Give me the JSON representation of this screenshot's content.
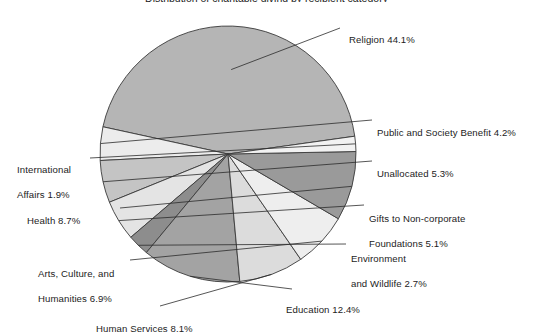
{
  "chart": {
    "title": "Distribution of charitable giving by recipient category",
    "title_visible": false
  },
  "chart_data": {
    "type": "pie",
    "title": "",
    "xlabel": "",
    "ylabel": "",
    "legend_position": "none",
    "grid": false,
    "units": "percent",
    "categories": [
      "Religion",
      "Public and Society Benefit",
      "Unallocated",
      "Gifts to Non-corporate Foundations",
      "Environment and Wildlife",
      "Education",
      "Human Services",
      "Arts, Culture, and Humanities",
      "Health",
      "International Affairs"
    ],
    "values": [
      44.1,
      4.2,
      5.3,
      5.1,
      2.7,
      12.4,
      8.1,
      6.9,
      8.7,
      1.9
    ],
    "slices": [
      {
        "label": "Religion 44.1%",
        "name": "Religion",
        "value": 44.1,
        "color": "#b5b5b5",
        "label_line1": "Religion 44.1%",
        "label_line2": ""
      },
      {
        "label": "Public and Society Benefit 4.2%",
        "name": "Public and Society Benefit",
        "value": 4.2,
        "color": "#ececec",
        "label_line1": "Public and Society Benefit 4.2%",
        "label_line2": ""
      },
      {
        "label": "Unallocated 5.3%",
        "name": "Unallocated",
        "value": 5.3,
        "color": "#c4c4c4",
        "label_line1": "Unallocated 5.3%",
        "label_line2": ""
      },
      {
        "label": "Gifts to Non-corporate Foundations 5.1%",
        "name": "Gifts to Non-corporate Foundations",
        "value": 5.1,
        "color": "#e4e4e4",
        "label_line1": "Gifts to Non-corporate",
        "label_line2": "Foundations 5.1%"
      },
      {
        "label": "Environment and Wildlife 2.7%",
        "name": "Environment and Wildlife",
        "value": 2.7,
        "color": "#8d8d8d",
        "label_line1": "Environment",
        "label_line2": "and Wildlife 2.7%"
      },
      {
        "label": "Education 12.4%",
        "name": "Education",
        "value": 12.4,
        "color": "#a3a3a3",
        "label_line1": "Education 12.4%",
        "label_line2": ""
      },
      {
        "label": "Human Services 8.1%",
        "name": "Human Services",
        "value": 8.1,
        "color": "#dcdcdc",
        "label_line1": "Human Services 8.1%",
        "label_line2": ""
      },
      {
        "label": "Arts, Culture, and Humanities 6.9%",
        "name": "Arts, Culture, and Humanities",
        "value": 6.9,
        "color": "#eeeeee",
        "label_line1": "Arts, Culture, and",
        "label_line2": "Humanities 6.9%"
      },
      {
        "label": "Health 8.7%",
        "name": "Health",
        "value": 8.7,
        "color": "#9a9a9a",
        "label_line1": "Health 8.7%",
        "label_line2": ""
      },
      {
        "label": "International Affairs 1.9%",
        "name": "International Affairs",
        "value": 1.9,
        "color": "#f2f2f2",
        "label_line1": "International",
        "label_line2": "Affairs 1.9%"
      }
    ]
  },
  "style": {
    "outline_color": "#3a3a3a",
    "leader_color": "#2b2b2b",
    "background": "#ffffff"
  }
}
